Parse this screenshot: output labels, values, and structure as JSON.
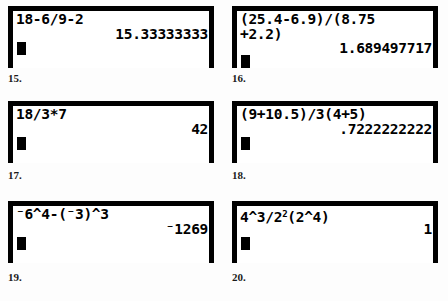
{
  "page": {
    "background_color": "#fdfdfd",
    "ink_color": "#000000",
    "screen_color": "#ffffff"
  },
  "problems": [
    {
      "number": "15.",
      "expression": "18-6/9-2",
      "result": "15.33333333",
      "cursor_row": "row3",
      "wrapped": false
    },
    {
      "number": "16.",
      "expression": "(25.4-6.9)/(8.75",
      "expression_cont": "+2.2)",
      "result": "1.689497717",
      "cursor_row": "row4",
      "wrapped": true
    },
    {
      "number": "17.",
      "expression": "18/3*7",
      "result": "42",
      "cursor_row": "row3",
      "wrapped": false
    },
    {
      "number": "18.",
      "expression": "(9+10.5)/3(4+5)",
      "result": ".7222222222",
      "cursor_row": "row3",
      "wrapped": false
    },
    {
      "number": "19.",
      "expression": "⁻6^4-(⁻3)^3",
      "result": "⁻1269",
      "cursor_row": "row3",
      "wrapped": false
    },
    {
      "number": "20.",
      "expression_pre": "4^3/2",
      "expression_sup": "2",
      "expression_post": "(2^4)",
      "result": "1",
      "cursor_row": "row3",
      "wrapped": false
    }
  ]
}
